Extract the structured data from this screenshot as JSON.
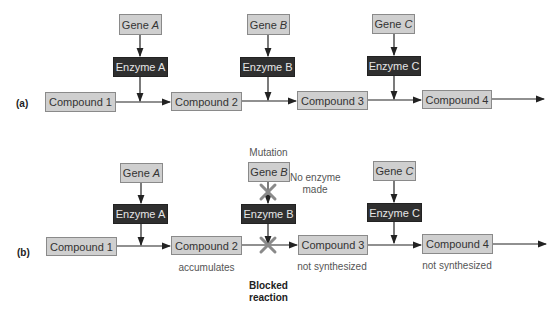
{
  "panel_a": {
    "label": "(a)",
    "genes": [
      {
        "prefix": "Gene",
        "letter": "A"
      },
      {
        "prefix": "Gene",
        "letter": "B"
      },
      {
        "prefix": "Gene",
        "letter": "C"
      }
    ],
    "enzymes": [
      "Enzyme A",
      "Enzyme B",
      "Enzyme C"
    ],
    "compounds": [
      "Compound 1",
      "Compound 2",
      "Compound 3",
      "Compound 4"
    ]
  },
  "panel_b": {
    "label": "(b)",
    "genes": [
      {
        "prefix": "Gene",
        "letter": "A"
      },
      {
        "prefix": "Gene",
        "letter": "B"
      },
      {
        "prefix": "Gene",
        "letter": "C"
      }
    ],
    "enzymes": [
      "Enzyme A",
      "Enzyme B",
      "Enzyme C"
    ],
    "compounds": [
      "Compound 1",
      "Compound 2",
      "Compound 3",
      "Compound 4"
    ],
    "mutation_label": "Mutation",
    "no_enzyme_line1": "No enzyme",
    "no_enzyme_line2": "made",
    "compound2_note": "accumulates",
    "compound3_note": "not synthesized",
    "compound4_note": "not synthesized",
    "blocked_line1": "Blocked",
    "blocked_line2": "reaction",
    "block_marker_color": "#8a8a8a"
  }
}
